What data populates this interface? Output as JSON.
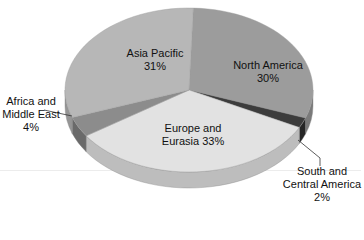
{
  "chart_data": {
    "type": "pie",
    "style": "3d",
    "title": "",
    "slices": [
      {
        "label": "North America",
        "value": 30,
        "color": "#9c9c9c",
        "side": "#7a7a7a"
      },
      {
        "label": "South and Central America",
        "value": 2,
        "color": "#3c3c3c",
        "side": "#262626"
      },
      {
        "label": "Europe and Eurasia",
        "value": 33,
        "color": "#e2e2e2",
        "side": "#bdbdbd"
      },
      {
        "label": "Africa and Middle East",
        "value": 4,
        "color": "#8c8c8c",
        "side": "#6a6a6a"
      },
      {
        "label": "Asia Pacific",
        "value": 31,
        "color": "#b7b7b7",
        "side": "#959595"
      }
    ],
    "start_angle_deg": 2,
    "legend": "none",
    "data_labels": true
  },
  "labels": {
    "asia_pacific": {
      "line1": "Asia Pacific",
      "line2": "31%"
    },
    "north_america": {
      "line1": "North America",
      "line2": "30%"
    },
    "africa": {
      "line1": "Africa and",
      "line2": "Middle East",
      "line3": "4%"
    },
    "europe": {
      "line1": "Europe and",
      "line2": "Eurasia 33%"
    },
    "south_america": {
      "line1": "South and",
      "line2": "Central America",
      "line3": "2%"
    }
  }
}
